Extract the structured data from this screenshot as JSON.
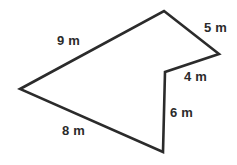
{
  "figure": {
    "name": "irregular-polygon-with-side-lengths",
    "unit": "m",
    "stroke_color": "#2b2b2b",
    "fill_color": "#ffffff",
    "background_color": "#ffffff",
    "label_color": "#2b2b2b",
    "stroke_width": 2.6,
    "vertices": [
      {
        "name": "top-vertex",
        "x": 164,
        "y": 11
      },
      {
        "name": "right-vertex",
        "x": 219,
        "y": 54
      },
      {
        "name": "concave-vertex",
        "x": 165,
        "y": 72
      },
      {
        "name": "notch-bottom-vertex",
        "x": 163,
        "y": 152
      },
      {
        "name": "left-vertex",
        "x": 20,
        "y": 89
      }
    ],
    "labels": [
      {
        "name": "side-label-9m",
        "text": "9 m",
        "x": 57,
        "y": 34,
        "side": "top-left-edge"
      },
      {
        "name": "side-label-5m",
        "text": "5 m",
        "x": 204,
        "y": 21,
        "side": "top-right-edge"
      },
      {
        "name": "side-label-4m",
        "text": "4 m",
        "x": 184,
        "y": 70,
        "side": "inner-upper-edge"
      },
      {
        "name": "side-label-6m",
        "text": "6 m",
        "x": 170,
        "y": 106,
        "side": "vertical-edge"
      },
      {
        "name": "side-label-8m",
        "text": "8 m",
        "x": 62,
        "y": 124,
        "side": "bottom-left-edge"
      }
    ]
  }
}
